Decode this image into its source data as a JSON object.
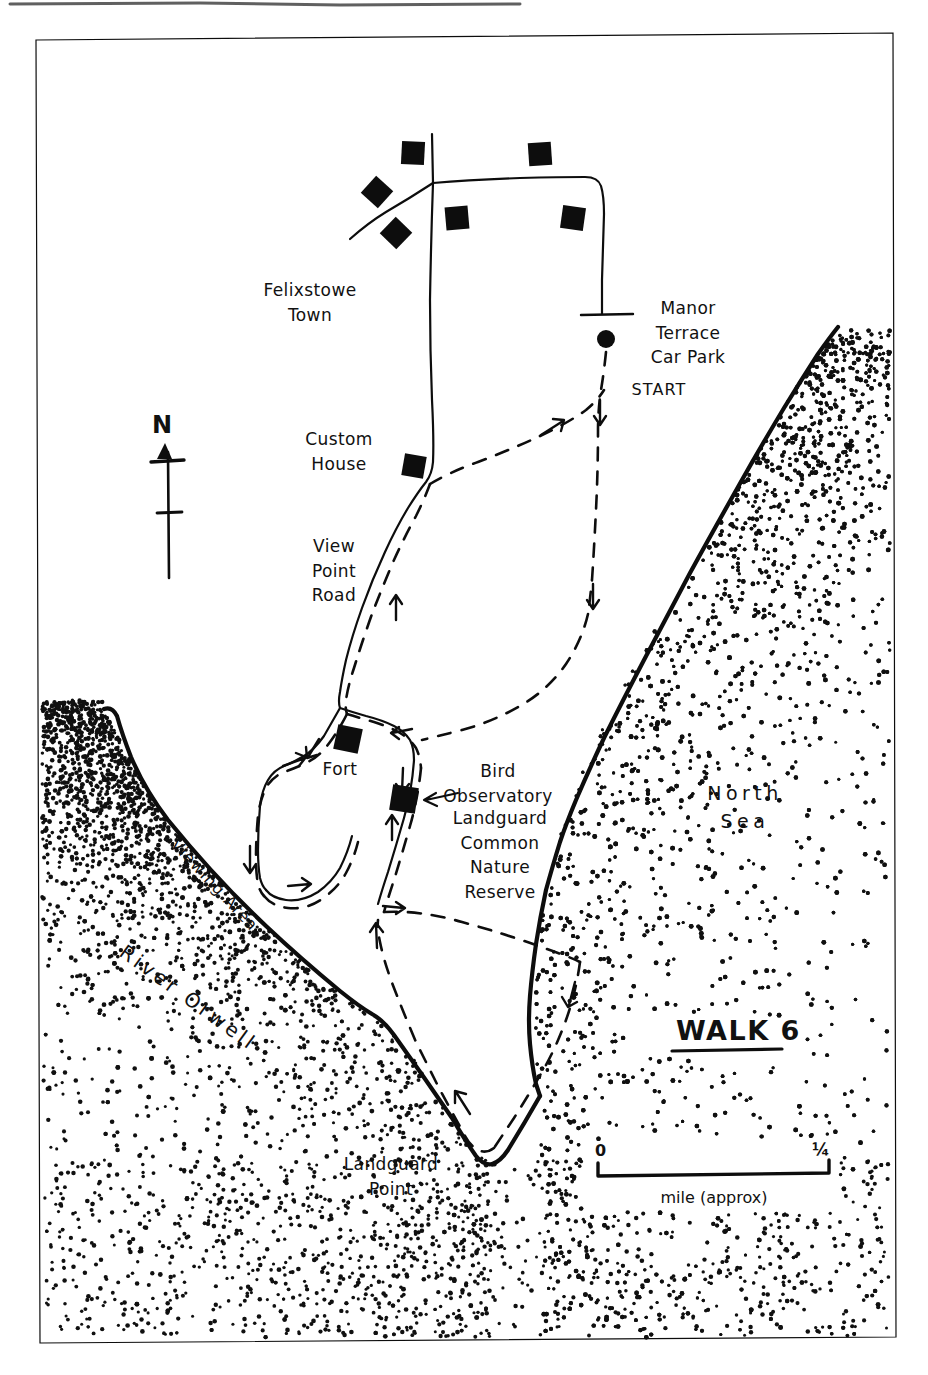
{
  "document": {
    "type": "hand-drawn walking route map",
    "title": "WALK 6",
    "paper_color": "#ffffff",
    "ink_color": "#0d0d0d"
  },
  "frame": {
    "name": "map-border",
    "description": "thin rectangular hand-ruled border around the map"
  },
  "walk_title": {
    "label": "WALK 6",
    "underlined": true
  },
  "compass": {
    "label": "N",
    "direction": "north-up"
  },
  "scale_bar": {
    "left_label": "0",
    "right_label": "¼",
    "caption": "mile (approx)"
  },
  "start_marker": {
    "label": "START",
    "place": "Manor Terrace Car Park",
    "place_lines": [
      "Manor",
      "Terrace",
      "Car Park"
    ]
  },
  "place_labels": [
    {
      "id": "felixstowe-town",
      "text_lines": [
        "Felixstowe",
        "Town"
      ],
      "x": 310,
      "y": 296,
      "size": 17,
      "rotate": 0,
      "letter_spacing": 0.4
    },
    {
      "id": "manor-terrace-car-park",
      "text_lines": [
        "Manor",
        "Terrace",
        "Car Park"
      ],
      "x": 688,
      "y": 314,
      "size": 17,
      "rotate": 0,
      "letter_spacing": 0.4
    },
    {
      "id": "start",
      "text_lines": [
        "START"
      ],
      "x": 659,
      "y": 395,
      "size": 16,
      "rotate": 0,
      "letter_spacing": 1.1
    },
    {
      "id": "custom-house",
      "text_lines": [
        "Custom",
        "House"
      ],
      "x": 339,
      "y": 445,
      "size": 17,
      "rotate": 0,
      "letter_spacing": 0.4
    },
    {
      "id": "view-point-road",
      "text_lines": [
        "View",
        "Point",
        "Road"
      ],
      "x": 334,
      "y": 552,
      "size": 17,
      "rotate": 0,
      "letter_spacing": 0.4
    },
    {
      "id": "fort",
      "text_lines": [
        "Fort"
      ],
      "x": 340,
      "y": 775,
      "size": 17,
      "rotate": 0,
      "letter_spacing": 0.4
    },
    {
      "id": "bird-observatory",
      "text_lines": [
        "Bird",
        "Observatory"
      ],
      "x": 498,
      "y": 777,
      "size": 17,
      "rotate": 0,
      "letter_spacing": 0.4
    },
    {
      "id": "landguard-common-nature-reserve",
      "text_lines": [
        "Landguard",
        "Common",
        "Nature",
        "Reserve"
      ],
      "x": 500,
      "y": 824,
      "size": 17,
      "rotate": 0,
      "letter_spacing": 0.4
    },
    {
      "id": "north-sea",
      "text_lines": [
        "North",
        "Sea"
      ],
      "x": 745,
      "y": 800,
      "size": 19,
      "rotate": 0,
      "letter_spacing": 4.5
    },
    {
      "id": "landguard-point",
      "text_lines": [
        "Landguard",
        "Point"
      ],
      "x": 391,
      "y": 1170,
      "size": 17,
      "rotate": 0,
      "letter_spacing": 0.4
    }
  ],
  "rotated_labels": [
    {
      "id": "viewing-area",
      "text": "Viewing Area",
      "x": 170,
      "y": 845,
      "size": 16,
      "rotate": 47,
      "letter_spacing": 1.2
    },
    {
      "id": "river-orwell",
      "text": "River Orwell",
      "x": 118,
      "y": 955,
      "size": 20,
      "rotate": 36,
      "letter_spacing": 3.5
    }
  ],
  "buildings": [
    {
      "id": "town-building-1",
      "x": 413,
      "y": 153,
      "size": 23,
      "rotate": 3
    },
    {
      "id": "town-building-2",
      "x": 540,
      "y": 154,
      "size": 23,
      "rotate": -4
    },
    {
      "id": "town-building-3",
      "x": 377,
      "y": 192,
      "size": 23,
      "rotate": 42
    },
    {
      "id": "town-building-4",
      "x": 457,
      "y": 218,
      "size": 23,
      "rotate": -5
    },
    {
      "id": "town-building-5",
      "x": 573,
      "y": 218,
      "size": 23,
      "rotate": 8
    },
    {
      "id": "town-building-6",
      "x": 396,
      "y": 233,
      "size": 23,
      "rotate": 44
    },
    {
      "id": "custom-house-building",
      "x": 414,
      "y": 466,
      "size": 22,
      "rotate": 10
    },
    {
      "id": "fort-building",
      "x": 348,
      "y": 739,
      "size": 25,
      "rotate": 12
    },
    {
      "id": "bird-observatory-building",
      "x": 404,
      "y": 799,
      "size": 26,
      "rotate": 9
    }
  ],
  "start_dot": {
    "x": 606,
    "y": 339,
    "r": 9
  },
  "legend_notes": {
    "route_style": "dashed line with direction arrows",
    "road_style": "solid thin line",
    "water_style": "stippled dot fill",
    "building_style": "solid black square"
  }
}
